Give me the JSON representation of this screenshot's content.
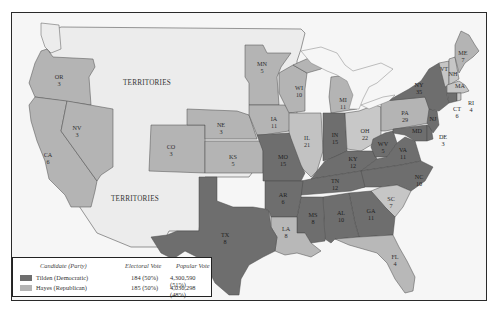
{
  "map": {
    "title": "",
    "colors": {
      "democratic": "#6e6e6e",
      "republican": "#b4b4b4",
      "territory": "#ececec",
      "water": "#f7f7f7",
      "border": "#4a4a4a"
    },
    "territories_label": "TERRITORIES",
    "territory_labels": [
      {
        "name": "territories-north",
        "text": "TERRITORIES"
      },
      {
        "name": "territories-south",
        "text": "TERRITORIES"
      }
    ],
    "states": [
      {
        "abbr": "OR",
        "votes": "3",
        "party": "republican"
      },
      {
        "abbr": "CA",
        "votes": "6",
        "party": "republican"
      },
      {
        "abbr": "NV",
        "votes": "3",
        "party": "republican"
      },
      {
        "abbr": "CO",
        "votes": "3",
        "party": "republican"
      },
      {
        "abbr": "MN",
        "votes": "5",
        "party": "republican"
      },
      {
        "abbr": "NE",
        "votes": "3",
        "party": "republican"
      },
      {
        "abbr": "KS",
        "votes": "5",
        "party": "republican"
      },
      {
        "abbr": "IA",
        "votes": "11",
        "party": "republican"
      },
      {
        "abbr": "WI",
        "votes": "10",
        "party": "republican"
      },
      {
        "abbr": "IL",
        "votes": "21",
        "party": "republican"
      },
      {
        "abbr": "MI",
        "votes": "11",
        "party": "republican"
      },
      {
        "abbr": "OH",
        "votes": "22",
        "party": "republican"
      },
      {
        "abbr": "PA",
        "votes": "29",
        "party": "republican"
      },
      {
        "abbr": "ME",
        "votes": "7",
        "party": "republican"
      },
      {
        "abbr": "VT",
        "votes": "5",
        "party": "republican"
      },
      {
        "abbr": "NH",
        "votes": "5",
        "party": "republican"
      },
      {
        "abbr": "MA",
        "votes": "13",
        "party": "republican"
      },
      {
        "abbr": "RI",
        "votes": "4",
        "party": "republican"
      },
      {
        "abbr": "SC",
        "votes": "7",
        "party": "republican"
      },
      {
        "abbr": "LA",
        "votes": "8",
        "party": "republican"
      },
      {
        "abbr": "FL",
        "votes": "4",
        "party": "republican"
      },
      {
        "abbr": "MO",
        "votes": "15",
        "party": "democratic"
      },
      {
        "abbr": "IN",
        "votes": "15",
        "party": "democratic"
      },
      {
        "abbr": "KY",
        "votes": "12",
        "party": "democratic"
      },
      {
        "abbr": "WV",
        "votes": "5",
        "party": "democratic"
      },
      {
        "abbr": "VA",
        "votes": "11",
        "party": "democratic"
      },
      {
        "abbr": "NY",
        "votes": "35",
        "party": "democratic"
      },
      {
        "abbr": "NJ",
        "votes": "9",
        "party": "democratic"
      },
      {
        "abbr": "CT",
        "votes": "6",
        "party": "democratic"
      },
      {
        "abbr": "DE",
        "votes": "3",
        "party": "democratic"
      },
      {
        "abbr": "MD",
        "votes": "8",
        "party": "democratic"
      },
      {
        "abbr": "NC",
        "votes": "10",
        "party": "democratic"
      },
      {
        "abbr": "TN",
        "votes": "12",
        "party": "democratic"
      },
      {
        "abbr": "AR",
        "votes": "6",
        "party": "democratic"
      },
      {
        "abbr": "MS",
        "votes": "8",
        "party": "democratic"
      },
      {
        "abbr": "AL",
        "votes": "10",
        "party": "democratic"
      },
      {
        "abbr": "GA",
        "votes": "11",
        "party": "democratic"
      },
      {
        "abbr": "TX",
        "votes": "8",
        "party": "democratic"
      }
    ]
  },
  "legend": {
    "headers": {
      "candidate": "Candidate (Party)",
      "electoral": "Electoral Vote",
      "popular": "Popular Vote"
    },
    "rows": [
      {
        "candidate": "Tilden (Democratic)",
        "electoral": "184 (50%)",
        "popular": "4,300,590 (51%)",
        "color": "#6e6e6e"
      },
      {
        "candidate": "Hayes (Republican)",
        "electoral": "185 (50%)",
        "popular": "4,036,298 (48%)",
        "color": "#b4b4b4"
      }
    ]
  }
}
